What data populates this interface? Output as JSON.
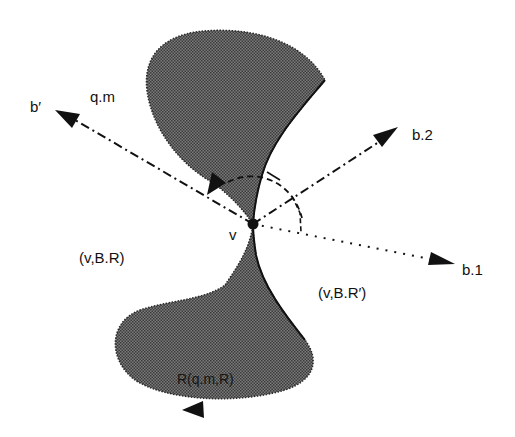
{
  "diagram": {
    "type": "geometric-region-diagram",
    "colors": {
      "region_fill": "#6e6e6e",
      "region_dots": "#3a3a3a",
      "stroke": "#111111",
      "background": "#ffffff"
    },
    "vertex": {
      "label": "v",
      "x": 253,
      "y": 224
    },
    "region": {
      "label": "R(q.m,R)"
    },
    "rays": [
      {
        "id": "b-prime",
        "label": "b′",
        "style": "dash-dot",
        "direction": "upper-left"
      },
      {
        "id": "b2",
        "label": "b.2",
        "style": "dash-dot",
        "direction": "upper-right"
      },
      {
        "id": "b1",
        "label": "b.1",
        "style": "dotted",
        "direction": "right"
      }
    ],
    "labels": {
      "qm": "q.m",
      "b_prime": "b′",
      "b2": "b.2",
      "b1": "b.1",
      "v": "v",
      "left_region": "(v,B.R)",
      "right_region": "(v,B.R′)",
      "region_name": "R(q.m,R)"
    }
  }
}
